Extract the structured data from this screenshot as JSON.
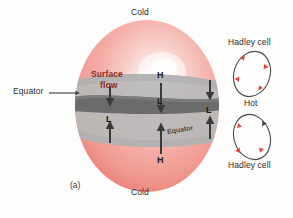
{
  "figure": {
    "caption": "(a)",
    "background_color": "#fdfdfc",
    "sphere": {
      "name": "earth-sphere",
      "fill_light": "#fdf0ee",
      "fill_mid": "#f4a9a2",
      "fill_edge": "#ef8e86",
      "highlight_color": "#ffffff"
    },
    "bands": {
      "tropical_band_color": "#b9b9b9",
      "equator_band_color": "#6d6d6d"
    },
    "labels": {
      "cold_top": "Cold",
      "cold_bottom": "Cold",
      "equator_left": "Equator",
      "equator_band": "Equator",
      "surface_flow_line1": "Surface",
      "surface_flow_line2": "flow",
      "hot": "Hot",
      "hadley_cell_top": "Hadley cell",
      "hadley_cell_bottom": "Hadley cell",
      "high_top": "H",
      "high_bottom": "H",
      "low_left": "L",
      "low_center": "L",
      "low_right": "L"
    },
    "colors": {
      "arrow_dark": "#3a3a3a",
      "surface_flow_text": "#8c2a22",
      "cell_arrow_red": "#e0453f",
      "cell_outline": "#4a4a4a",
      "label_text": "#2c2c2c"
    },
    "hadley_cells": [
      {
        "name": "hadley-cell-top",
        "arrow_count": 4,
        "direction": "clockwise"
      },
      {
        "name": "hadley-cell-bottom",
        "arrow_count": 4,
        "direction": "counterclockwise"
      }
    ],
    "flow_arrows": {
      "downward_count": 3,
      "upward_count": 3
    }
  }
}
